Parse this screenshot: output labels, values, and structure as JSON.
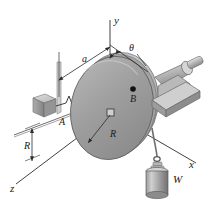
{
  "figure": {
    "background_color": "#ffffff",
    "line_color": "#2b2b2b",
    "axes": [
      {
        "id": "y",
        "label": "y",
        "direction": "vertical-up"
      },
      {
        "id": "x",
        "label": "x",
        "direction": "right-down-oblique"
      },
      {
        "id": "z",
        "label": "z",
        "direction": "left-down-oblique"
      }
    ],
    "angle": {
      "symbol": "θ",
      "from_axis": "y",
      "to_point": "B"
    },
    "dimensions": [
      {
        "id": "a",
        "label": "a",
        "between": [
          "support-A",
          "origin-O"
        ],
        "style": "double-arrow"
      },
      {
        "id": "R-vertical",
        "label": "R",
        "between": [
          "z-axis",
          "support-base"
        ],
        "style": "double-arrow"
      },
      {
        "id": "R-radial",
        "label": "R",
        "from": "disk-center",
        "to": "disk-rim",
        "style": "single-arrow"
      }
    ],
    "points": [
      {
        "id": "A",
        "label": "A",
        "description": "spring anchor at support block"
      },
      {
        "id": "B",
        "label": "B",
        "description": "marked point on disk face"
      },
      {
        "id": "O",
        "label": "",
        "description": "disk center / shaft axis"
      }
    ],
    "bodies": [
      {
        "id": "disk",
        "label": "",
        "type": "circular-disk",
        "fill": "#9a9a9a"
      },
      {
        "id": "weight",
        "label": "W",
        "type": "hanging-cylinder",
        "fill": "#8f8f8f"
      },
      {
        "id": "bearing",
        "label": "",
        "type": "bearing-block",
        "fill": "#b5b5b5"
      },
      {
        "id": "support-block",
        "label": "",
        "type": "support-post",
        "fill": "#b0b0b0"
      },
      {
        "id": "spring",
        "label": "",
        "type": "coil-spring"
      },
      {
        "id": "cord",
        "label": "",
        "type": "cord-over-rim"
      }
    ],
    "colors": {
      "disk_face": "#9d9d9d",
      "disk_rim": "#8a8a8a",
      "disk_highlight": "#c2c2c2",
      "metal_light": "#d2d2d2",
      "metal_mid": "#a9a9a9",
      "metal_dark": "#7d7d7d",
      "stroke": "#2b2b2b",
      "point_marker": "#111111"
    }
  }
}
